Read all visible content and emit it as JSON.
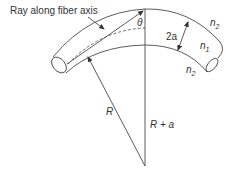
{
  "diagram": {
    "caption_label": "Ray along fiber axis",
    "labels": {
      "theta": "θ",
      "core_diameter": "2a",
      "cladding_top": "n",
      "cladding_top_sub": "2",
      "core": "n",
      "core_sub": "1",
      "cladding_bottom": "n",
      "cladding_bottom_sub": "2",
      "radius_inner": "R",
      "radius_outer": "R + a"
    },
    "colors": {
      "line": "#4a4a4a",
      "text": "#333333",
      "background": "#ffffff"
    }
  }
}
